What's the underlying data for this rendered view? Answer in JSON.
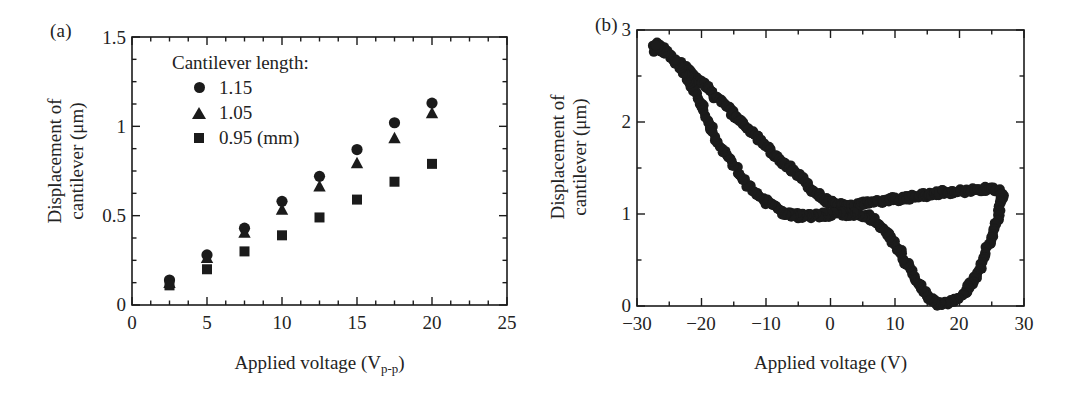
{
  "figure": {
    "background": "#ffffff",
    "ink_color": "#1b1b1b",
    "panels": [
      {
        "label": "(a)"
      },
      {
        "label": "(b)"
      }
    ]
  },
  "panel_a": {
    "label": "(a)",
    "legend": {
      "title": "Cantilever length:",
      "entries": [
        {
          "marker": "circle",
          "label": "1.15"
        },
        {
          "marker": "triangle",
          "label": "1.05"
        },
        {
          "marker": "square",
          "label": "0.95 (mm)"
        }
      ]
    },
    "x_axis": {
      "title_main": "Applied voltage (V",
      "title_sub": "p-p",
      "title_tail": ")",
      "title_full": "Applied voltage (Vp-p)",
      "tick_labels": [
        "0",
        "5",
        "10",
        "15",
        "20",
        "25"
      ]
    },
    "y_axis": {
      "title_line1": "Displacement of",
      "title_line2": "cantilever (μm)",
      "tick_labels": [
        "0",
        "0.5",
        "1",
        "1.5"
      ]
    }
  },
  "panel_b": {
    "label": "(b)",
    "x_axis": {
      "title": "Applied voltage (V)",
      "tick_labels": [
        "−30",
        "−20",
        "−10",
        "0",
        "10",
        "20",
        "30"
      ]
    },
    "y_axis": {
      "title_line1": "Displacement of",
      "title_line2": "cantilever (μm)",
      "tick_labels": [
        "0",
        "1",
        "2",
        "3"
      ]
    }
  },
  "chart_data": [
    {
      "type": "scatter",
      "panel": "(a)",
      "title": "",
      "xlabel": "Applied voltage (Vp-p)",
      "ylabel": "Displacement of cantilever (μm)",
      "xlim": [
        0,
        25
      ],
      "ylim": [
        0,
        1.5
      ],
      "xticks": [
        0,
        5,
        10,
        15,
        20,
        25
      ],
      "yticks": [
        0,
        0.5,
        1,
        1.5
      ],
      "xminor_step": 1.25,
      "yminor_step": 0.125,
      "grid": false,
      "legend_position": "upper-left-inside",
      "legend_title": "Cantilever length:",
      "x": [
        2.5,
        5,
        7.5,
        10,
        12.5,
        15,
        17.5,
        20
      ],
      "series": [
        {
          "name": "1.15",
          "marker": "circle",
          "values": [
            0.14,
            0.28,
            0.43,
            0.58,
            0.72,
            0.87,
            1.02,
            1.13
          ]
        },
        {
          "name": "1.05",
          "marker": "triangle",
          "values": [
            0.12,
            0.26,
            0.4,
            0.53,
            0.66,
            0.79,
            0.93,
            1.07
          ]
        },
        {
          "name": "0.95 (mm)",
          "marker": "square",
          "values": [
            0.11,
            0.2,
            0.3,
            0.39,
            0.49,
            0.59,
            0.69,
            0.79
          ]
        }
      ]
    },
    {
      "type": "scatter",
      "panel": "(b)",
      "title": "",
      "xlabel": "Applied voltage (V)",
      "ylabel": "Displacement of cantilever (μm)",
      "xlim": [
        -30,
        30
      ],
      "ylim": [
        0,
        3
      ],
      "xticks": [
        -30,
        -20,
        -10,
        0,
        10,
        20,
        30
      ],
      "yticks": [
        0,
        1,
        2,
        3
      ],
      "xminor_step": 5,
      "yminor_step": 0.5,
      "grid": false,
      "description": "Butterfly hysteresis loop of cantilever displacement versus bipolar applied voltage",
      "branches": [
        {
          "name": "upper-branch-decreasing-voltage",
          "points": [
            [
              -27.5,
              2.78
            ],
            [
              -27.0,
              2.86
            ],
            [
              -26.2,
              2.8
            ],
            [
              -25.4,
              2.74
            ],
            [
              -24.6,
              2.7
            ],
            [
              -23.8,
              2.66
            ],
            [
              -23.0,
              2.62
            ],
            [
              -22.2,
              2.57
            ],
            [
              -21.4,
              2.52
            ],
            [
              -20.6,
              2.46
            ],
            [
              -19.8,
              2.42
            ],
            [
              -19.0,
              2.36
            ],
            [
              -18.2,
              2.3
            ],
            [
              -17.4,
              2.25
            ],
            [
              -16.6,
              2.2
            ],
            [
              -15.8,
              2.14
            ],
            [
              -15.0,
              2.08
            ],
            [
              -14.2,
              2.02
            ],
            [
              -13.4,
              1.97
            ],
            [
              -12.6,
              1.92
            ],
            [
              -11.8,
              1.86
            ],
            [
              -11.0,
              1.8
            ],
            [
              -10.2,
              1.74
            ],
            [
              -9.4,
              1.68
            ],
            [
              -8.6,
              1.62
            ],
            [
              -7.8,
              1.58
            ],
            [
              -7.0,
              1.53
            ],
            [
              -6.2,
              1.5
            ],
            [
              -5.4,
              1.45
            ],
            [
              -4.6,
              1.4
            ],
            [
              -3.8,
              1.34
            ],
            [
              -3.0,
              1.28
            ],
            [
              -2.2,
              1.22
            ],
            [
              -1.4,
              1.18
            ],
            [
              -0.6,
              1.14
            ],
            [
              0.2,
              1.12
            ],
            [
              1.0,
              1.1
            ],
            [
              2.0,
              1.09
            ],
            [
              3.0,
              1.09
            ],
            [
              4.0,
              1.1
            ],
            [
              5.0,
              1.11
            ],
            [
              6.0,
              1.12
            ],
            [
              7.0,
              1.13
            ],
            [
              8.0,
              1.14
            ],
            [
              9.0,
              1.15
            ],
            [
              10.0,
              1.16
            ],
            [
              11.0,
              1.17
            ],
            [
              12.0,
              1.18
            ],
            [
              13.0,
              1.19
            ],
            [
              14.0,
              1.2
            ],
            [
              15.0,
              1.21
            ],
            [
              16.0,
              1.22
            ],
            [
              17.0,
              1.23
            ],
            [
              18.0,
              1.24
            ],
            [
              19.0,
              1.24
            ],
            [
              20.0,
              1.25
            ],
            [
              21.0,
              1.25
            ],
            [
              22.0,
              1.26
            ],
            [
              23.0,
              1.26
            ],
            [
              24.0,
              1.27
            ],
            [
              25.0,
              1.27
            ],
            [
              26.0,
              1.26
            ],
            [
              26.8,
              1.24
            ]
          ]
        },
        {
          "name": "lower-branch-rising-from-minimum",
          "points": [
            [
              26.8,
              1.24
            ],
            [
              26.6,
              1.16
            ],
            [
              26.2,
              1.05
            ],
            [
              25.8,
              0.94
            ],
            [
              25.3,
              0.82
            ],
            [
              24.8,
              0.72
            ],
            [
              24.3,
              0.62
            ],
            [
              23.8,
              0.52
            ],
            [
              23.2,
              0.43
            ],
            [
              22.6,
              0.34
            ],
            [
              22.0,
              0.26
            ],
            [
              21.3,
              0.19
            ],
            [
              20.6,
              0.13
            ],
            [
              19.8,
              0.08
            ],
            [
              19.0,
              0.05
            ],
            [
              18.2,
              0.03
            ],
            [
              17.4,
              0.02
            ],
            [
              16.6,
              0.03
            ],
            [
              15.8,
              0.06
            ],
            [
              15.0,
              0.11
            ],
            [
              14.2,
              0.18
            ],
            [
              13.5,
              0.26
            ],
            [
              12.8,
              0.35
            ],
            [
              12.1,
              0.44
            ],
            [
              11.4,
              0.52
            ],
            [
              10.7,
              0.6
            ],
            [
              10.0,
              0.67
            ],
            [
              9.3,
              0.74
            ],
            [
              8.6,
              0.8
            ],
            [
              7.9,
              0.86
            ],
            [
              7.2,
              0.9
            ],
            [
              6.5,
              0.94
            ],
            [
              5.8,
              0.97
            ],
            [
              5.0,
              0.99
            ],
            [
              4.0,
              1.0
            ],
            [
              3.0,
              1.0
            ],
            [
              2.0,
              1.0
            ],
            [
              1.0,
              1.0
            ],
            [
              0.0,
              0.99
            ],
            [
              -1.0,
              0.99
            ],
            [
              -2.0,
              0.98
            ],
            [
              -3.0,
              0.98
            ],
            [
              -4.0,
              0.98
            ],
            [
              -5.0,
              0.98
            ],
            [
              -6.0,
              0.99
            ],
            [
              -7.0,
              1.01
            ],
            [
              -8.0,
              1.04
            ],
            [
              -9.0,
              1.08
            ],
            [
              -10.0,
              1.13
            ],
            [
              -11.0,
              1.19
            ],
            [
              -12.0,
              1.26
            ],
            [
              -13.0,
              1.34
            ],
            [
              -14.0,
              1.43
            ],
            [
              -15.0,
              1.52
            ],
            [
              -16.0,
              1.62
            ],
            [
              -17.0,
              1.72
            ],
            [
              -17.8,
              1.82
            ],
            [
              -18.5,
              1.92
            ],
            [
              -19.2,
              2.03
            ],
            [
              -19.8,
              2.14
            ],
            [
              -20.4,
              2.24
            ],
            [
              -21.0,
              2.33
            ],
            [
              -21.6,
              2.41
            ],
            [
              -22.2,
              2.49
            ],
            [
              -23.0,
              2.57
            ],
            [
              -23.8,
              2.64
            ],
            [
              -24.6,
              2.7
            ],
            [
              -25.4,
              2.75
            ],
            [
              -26.2,
              2.8
            ],
            [
              -27.0,
              2.85
            ]
          ]
        }
      ]
    }
  ]
}
